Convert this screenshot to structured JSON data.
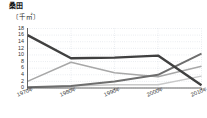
{
  "chart": {
    "title": "桑田",
    "unit_label": "〔千㎡〕"
  },
  "chart_data": {
    "type": "line",
    "title": "桑田",
    "xlabel": "",
    "ylabel": "千㎡",
    "ylim": [
      0,
      18
    ],
    "ytick_step": 2,
    "grid": true,
    "legend": "none",
    "categories": [
      "1970年",
      "1980年",
      "1990年",
      "2000年",
      "2010年"
    ],
    "yticks": [
      "18",
      "16",
      "14",
      "12",
      "10",
      "8",
      "6",
      "4",
      "2",
      "0"
    ],
    "series": [
      {
        "name": "series-dark",
        "color": "#404040",
        "width": 2.4,
        "values": [
          16.0,
          9.0,
          9.2,
          9.8,
          0.8
        ]
      },
      {
        "name": "series-mid-dark",
        "color": "#6e6e6e",
        "width": 2.0,
        "values": [
          0.2,
          0.6,
          2.0,
          4.0,
          10.4
        ]
      },
      {
        "name": "series-mid-light",
        "color": "#a8a8a8",
        "width": 1.6,
        "values": [
          2.0,
          7.8,
          4.6,
          3.4,
          6.6
        ]
      },
      {
        "name": "series-light",
        "color": "#c9c9c9",
        "width": 1.4,
        "values": [
          0.1,
          0.6,
          1.0,
          1.0,
          3.6
        ]
      }
    ]
  },
  "xticks": [
    {
      "year": "1970",
      "suffix": "年"
    },
    {
      "year": "1980",
      "suffix": "年"
    },
    {
      "year": "1990",
      "suffix": "年"
    },
    {
      "year": "2000",
      "suffix": "年"
    },
    {
      "year": "2010",
      "suffix": "年"
    }
  ]
}
